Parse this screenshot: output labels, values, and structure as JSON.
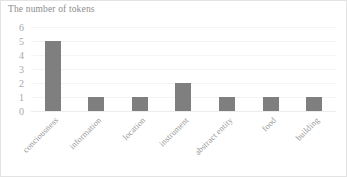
{
  "chart_data": {
    "type": "bar",
    "title": "The number of tokens",
    "xlabel": "",
    "ylabel": "",
    "categories": [
      "conciousness",
      "information",
      "location",
      "instrument",
      "abstract entity",
      "food",
      "building"
    ],
    "values": [
      5,
      1,
      1,
      2,
      1,
      1,
      1
    ],
    "yticks": [
      "0",
      "1",
      "2",
      "3",
      "4",
      "5",
      "6"
    ],
    "ytick_values": [
      0,
      1,
      2,
      3,
      4,
      5,
      6
    ],
    "ylim": [
      0,
      6
    ],
    "grid": true,
    "legend": "none",
    "bar_color": "#7f7f7f",
    "title_color": "#8d8d8d",
    "tick_color": "#a8a8a8",
    "gridline_color": "#f4f4f4",
    "border_color": "#e3e3e3"
  }
}
